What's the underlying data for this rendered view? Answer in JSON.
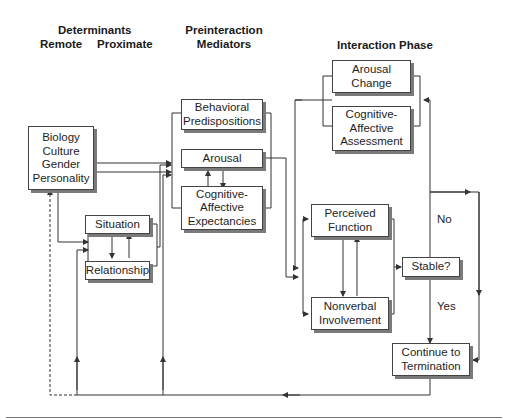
{
  "headers": {
    "determinants": "Determinants",
    "remote": "Remote",
    "proximate": "Proximate",
    "preinteraction": "Preinteraction\nMediators",
    "interaction_phase": "Interaction Phase"
  },
  "nodes": {
    "biology": "Biology\nCulture\nGender\nPersonality",
    "situation": "Situation",
    "relationship": "Relationship",
    "behavioral": "Behavioral\nPredispositions",
    "arousal": "Arousal",
    "cog_expect": "Cognitive-\nAffective\nExpectancies",
    "arousal_change": "Arousal\nChange",
    "cog_assess": "Cognitive-\nAffective\nAssessment",
    "perceived": "Perceived\nFunction",
    "nonverbal": "Nonverbal\nInvolvement",
    "stable": "Stable?",
    "continue": "Continue to\nTermination"
  },
  "edge_labels": {
    "no": "No",
    "yes": "Yes"
  },
  "colors": {
    "line": "#333333",
    "shadow": "#7a7a7a"
  }
}
